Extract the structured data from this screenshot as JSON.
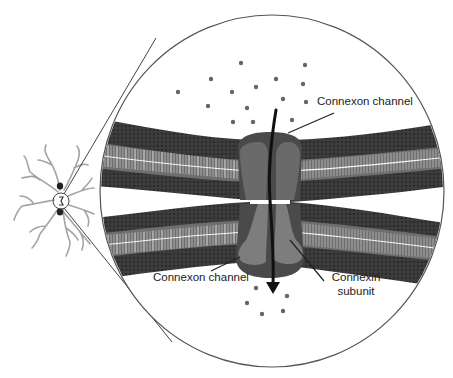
{
  "diagram": {
    "labels": {
      "connexon_top": "Connexon channel",
      "connexon_bottom": "Connexon channel",
      "connexin_line1": "Connexin",
      "connexin_line2": "subunit"
    },
    "colors": {
      "background": "#ffffff",
      "membrane_dark": "#3a3a3a",
      "membrane_mid": "#555555",
      "tail_light": "#e8e8e8",
      "connexon_dark": "#4a4a4a",
      "connexon_mid": "#6a6a6a",
      "connexon_light": "#7d7d7d",
      "dot": "#666666",
      "outline": "#444444",
      "neuron": "#9a9a9a"
    },
    "magnifier": {
      "cx": 272,
      "cy": 191,
      "rx": 172,
      "ry": 176
    },
    "neuron": {
      "focus_cx": 61,
      "focus_cy": 201,
      "focus_r": 8
    },
    "ions_top": [
      [
        241,
        63
      ],
      [
        305,
        65
      ],
      [
        211,
        79
      ],
      [
        276,
        79
      ],
      [
        178,
        92
      ],
      [
        232,
        92
      ],
      [
        256,
        87
      ],
      [
        208,
        106
      ],
      [
        247,
        108
      ],
      [
        283,
        99
      ],
      [
        306,
        102
      ],
      [
        233,
        122
      ],
      [
        253,
        122
      ],
      [
        292,
        120
      ],
      [
        303,
        84
      ]
    ],
    "ions_bottom": [
      [
        256,
        288
      ],
      [
        247,
        303
      ],
      [
        262,
        314
      ],
      [
        287,
        296
      ],
      [
        283,
        311
      ]
    ]
  }
}
